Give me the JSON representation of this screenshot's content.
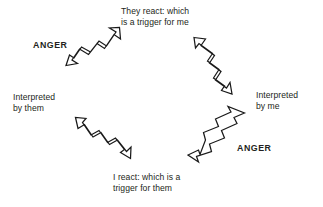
{
  "diagram": {
    "background_color": "#ffffff",
    "stroke_color": "#1a1a1a",
    "text_color": "#231f20",
    "labels": {
      "top": "They react: which\nis a trigger for me",
      "right": "Interpreted\nby me",
      "bottom": "I react: which is a\ntrigger for them",
      "left": "Interpreted\nby them",
      "anger_left": "ANGER",
      "anger_right": "ANGER"
    },
    "arrows": [
      {
        "id": "arrow-upper-left",
        "name": "zigzag-arrow-up-right",
        "direction": "up-right",
        "double_headed": true
      },
      {
        "id": "arrow-upper-right",
        "name": "zigzag-arrow-down-right",
        "direction": "down-right",
        "double_headed": true
      },
      {
        "id": "arrow-lower-right",
        "name": "zigzag-arrow-down-left",
        "direction": "down-left",
        "double_headed": true
      },
      {
        "id": "arrow-lower-left",
        "name": "zigzag-arrow-up-left",
        "direction": "up-left",
        "double_headed": true
      }
    ]
  }
}
